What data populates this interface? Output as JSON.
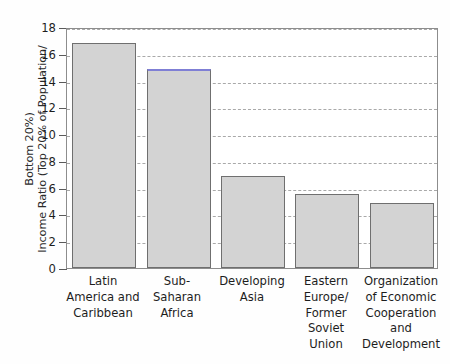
{
  "chart_data": {
    "type": "bar",
    "title": "",
    "xlabel": "",
    "ylabel": "Income Ratio (Top 20% of Population/ Bottom 20%)",
    "ylabel_lines": [
      "Income Ratio (Top 20% of Population/",
      "Bottom 20%)"
    ],
    "ylim": [
      0,
      18
    ],
    "ytick_labels": [
      "0",
      "2",
      "4",
      "6",
      "8",
      "10",
      "12",
      "14",
      "16",
      "18"
    ],
    "ytick_values": [
      0,
      2,
      4,
      6,
      8,
      10,
      12,
      14,
      16,
      18
    ],
    "grid": "horizontal-dashed",
    "legend": "none",
    "categories": [
      "Latin America and Caribbean",
      "Sub-Saharan Africa",
      "Developing Asia",
      "Eastern Europe/ Former Soviet Union",
      "Organization of Economic Cooperation and Development"
    ],
    "category_lines": [
      [
        "Latin",
        "America and",
        "Caribbean"
      ],
      [
        "Sub-",
        "Saharan",
        "Africa"
      ],
      [
        "Developing",
        "Asia"
      ],
      [
        "Eastern",
        "Europe/",
        "Former",
        "Soviet",
        "Union"
      ],
      [
        "Organization",
        "of Economic",
        "Cooperation",
        "and",
        "Development"
      ]
    ],
    "values": [
      16.8,
      14.9,
      6.9,
      5.5,
      4.85
    ],
    "bar_fill_color": "#d3d3d3",
    "bar_border_color": "#6f6f6f",
    "accent_color": "#7f7fd5",
    "gridline_color": "#9b9b9b",
    "axis_color": "#8d8d8d",
    "text_color": "#1d1d1d",
    "background_color": "#fefefe"
  }
}
